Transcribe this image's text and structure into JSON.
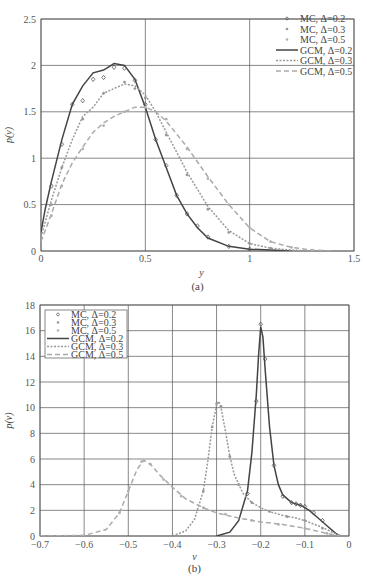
{
  "chart_data": [
    {
      "id": "a",
      "type": "line",
      "caption": "(a)",
      "xlabel": "y",
      "ylabel": "p(y)",
      "xlim": [
        0,
        1.5
      ],
      "ylim": [
        0,
        2.5
      ],
      "xticks": [
        "0",
        "0.5",
        "1",
        "1.5"
      ],
      "yticks": [
        "0",
        "0.5",
        "1",
        "1.5",
        "2",
        "2.5"
      ],
      "grid": true,
      "legend_position": "upper right",
      "legend": [
        "MC, Δ=0.2",
        "MC, Δ=0.3",
        "MC, Δ=0.5",
        "GCM, Δ=0.2",
        "GCM, Δ=0.3",
        "GCM, Δ=0.5"
      ],
      "series": [
        {
          "name": "GCM, Δ=0.2",
          "style": "solid",
          "color": "#444444",
          "x": [
            0,
            0.02,
            0.05,
            0.1,
            0.15,
            0.2,
            0.25,
            0.3,
            0.35,
            0.4,
            0.45,
            0.5,
            0.55,
            0.6,
            0.65,
            0.7,
            0.75,
            0.8,
            0.9,
            1.0,
            1.1,
            1.2
          ],
          "y": [
            0.2,
            0.45,
            0.75,
            1.2,
            1.58,
            1.78,
            1.92,
            1.95,
            2.02,
            2.0,
            1.85,
            1.55,
            1.2,
            0.9,
            0.6,
            0.4,
            0.25,
            0.14,
            0.05,
            0.02,
            0.01,
            0.0
          ]
        },
        {
          "name": "GCM, Δ=0.3",
          "style": "dotted",
          "color": "#999999",
          "x": [
            0,
            0.05,
            0.1,
            0.15,
            0.2,
            0.25,
            0.3,
            0.35,
            0.4,
            0.45,
            0.5,
            0.55,
            0.6,
            0.7,
            0.8,
            0.9,
            1.0,
            1.1,
            1.2,
            1.3
          ],
          "y": [
            0.15,
            0.55,
            0.9,
            1.2,
            1.45,
            1.55,
            1.7,
            1.75,
            1.8,
            1.78,
            1.68,
            1.5,
            1.28,
            0.85,
            0.48,
            0.22,
            0.08,
            0.03,
            0.01,
            0.0
          ]
        },
        {
          "name": "GCM, Δ=0.5",
          "style": "dashed",
          "color": "#aaaaaa",
          "x": [
            0,
            0.05,
            0.1,
            0.15,
            0.2,
            0.25,
            0.3,
            0.35,
            0.4,
            0.45,
            0.5,
            0.55,
            0.6,
            0.7,
            0.8,
            0.9,
            1.0,
            1.1,
            1.2,
            1.3,
            1.4
          ],
          "y": [
            0.1,
            0.4,
            0.72,
            0.95,
            1.12,
            1.28,
            1.38,
            1.45,
            1.5,
            1.55,
            1.55,
            1.5,
            1.4,
            1.12,
            0.8,
            0.5,
            0.25,
            0.1,
            0.04,
            0.01,
            0.0
          ]
        },
        {
          "name": "MC, Δ=0.2",
          "style": "marker-diamond",
          "color": "#555555",
          "x": [
            0.05,
            0.1,
            0.15,
            0.2,
            0.25,
            0.3,
            0.35,
            0.4,
            0.45,
            0.5,
            0.55,
            0.6,
            0.65,
            0.7,
            0.75,
            0.8,
            0.9,
            1.0
          ],
          "y": [
            0.7,
            1.15,
            1.58,
            1.62,
            1.85,
            1.87,
            1.98,
            1.97,
            1.84,
            1.58,
            1.2,
            0.92,
            0.6,
            0.4,
            0.27,
            0.15,
            0.05,
            0.02
          ]
        },
        {
          "name": "MC, Δ=0.3",
          "style": "marker",
          "color": "#999999",
          "x": [
            0.05,
            0.1,
            0.2,
            0.3,
            0.4,
            0.45,
            0.5,
            0.6,
            0.7,
            0.8,
            0.9,
            1.0,
            1.1
          ],
          "y": [
            0.5,
            0.9,
            1.42,
            1.7,
            1.82,
            1.75,
            1.65,
            1.25,
            0.82,
            0.45,
            0.2,
            0.08,
            0.03
          ]
        },
        {
          "name": "MC, Δ=0.5",
          "style": "marker",
          "color": "#b0b0b0",
          "x": [
            0.05,
            0.1,
            0.2,
            0.3,
            0.4,
            0.5,
            0.6,
            0.7,
            0.8,
            0.9,
            1.0,
            1.1,
            1.2,
            1.3
          ],
          "y": [
            0.38,
            0.7,
            1.1,
            1.35,
            1.5,
            1.55,
            1.42,
            1.1,
            0.78,
            0.5,
            0.25,
            0.1,
            0.04,
            0.01
          ]
        }
      ]
    },
    {
      "id": "b",
      "type": "line",
      "caption": "(b)",
      "xlabel": "v",
      "ylabel": "p(v)",
      "xlim": [
        -0.7,
        0
      ],
      "ylim": [
        0,
        18
      ],
      "xticks": [
        "−0.7",
        "−0.6",
        "−0.5",
        "−0.4",
        "−0.3",
        "−0.2",
        "−0.1",
        "0"
      ],
      "yticks": [
        "0",
        "2",
        "4",
        "6",
        "8",
        "10",
        "12",
        "14",
        "16",
        "18"
      ],
      "grid": true,
      "legend_position": "upper left",
      "legend": [
        "MC, Δ=0.2",
        "MC, Δ=0.3",
        "MC, Δ=0.5",
        "GCM, Δ=0.2",
        "GCM, Δ=0.3",
        "GCM, Δ=0.5"
      ],
      "series": [
        {
          "name": "GCM, Δ=0.2",
          "style": "solid",
          "color": "#444444",
          "x": [
            -0.3,
            -0.27,
            -0.25,
            -0.23,
            -0.22,
            -0.21,
            -0.205,
            -0.2,
            -0.195,
            -0.19,
            -0.18,
            -0.17,
            -0.16,
            -0.15,
            -0.13,
            -0.11,
            -0.09,
            -0.07,
            -0.05,
            -0.03,
            -0.02
          ],
          "y": [
            0,
            0.3,
            1.2,
            3.5,
            6.5,
            11,
            14,
            16.3,
            15.5,
            13,
            8.5,
            5.5,
            4,
            3.2,
            2.6,
            2.4,
            2.0,
            1.4,
            0.8,
            0.2,
            0
          ]
        },
        {
          "name": "GCM, Δ=0.3",
          "style": "dotted",
          "color": "#999999",
          "x": [
            -0.4,
            -0.37,
            -0.35,
            -0.33,
            -0.32,
            -0.31,
            -0.3,
            -0.295,
            -0.29,
            -0.28,
            -0.27,
            -0.26,
            -0.24,
            -0.22,
            -0.2,
            -0.18,
            -0.15,
            -0.12,
            -0.1,
            -0.07,
            -0.05,
            -0.02
          ],
          "y": [
            0,
            0.4,
            1.3,
            3.5,
            5.8,
            8.5,
            10.2,
            10.5,
            10.0,
            8.2,
            6.2,
            4.8,
            3.3,
            2.6,
            2.2,
            1.9,
            1.6,
            1.4,
            1.2,
            0.8,
            0.5,
            0
          ]
        },
        {
          "name": "GCM, Δ=0.5",
          "style": "dashed",
          "color": "#aaaaaa",
          "x": [
            -0.7,
            -0.6,
            -0.55,
            -0.52,
            -0.5,
            -0.48,
            -0.465,
            -0.45,
            -0.43,
            -0.4,
            -0.37,
            -0.33,
            -0.3,
            -0.25,
            -0.2,
            -0.15,
            -0.1,
            -0.05,
            -0.02
          ],
          "y": [
            0,
            0.05,
            0.5,
            1.8,
            3.5,
            5.2,
            5.9,
            5.6,
            4.8,
            3.8,
            2.9,
            2.2,
            1.8,
            1.4,
            1.1,
            0.9,
            0.6,
            0.2,
            0
          ]
        },
        {
          "name": "MC, Δ=0.2",
          "style": "marker-diamond",
          "color": "#555555",
          "x": [
            -0.23,
            -0.21,
            -0.2,
            -0.19,
            -0.17,
            -0.15,
            -0.13,
            -0.12,
            -0.11,
            -0.1,
            -0.08,
            -0.06
          ],
          "y": [
            3.3,
            10.5,
            16.5,
            13.8,
            5.5,
            3.1,
            2.6,
            2.5,
            2.4,
            2.3,
            1.8,
            1.2
          ]
        },
        {
          "name": "MC, Δ=0.3",
          "style": "marker",
          "color": "#999999",
          "x": [
            -0.33,
            -0.31,
            -0.3,
            -0.29,
            -0.27,
            -0.25,
            -0.22,
            -0.18,
            -0.14,
            -0.1,
            -0.06
          ],
          "y": [
            3.5,
            8.5,
            10.3,
            10.1,
            6.2,
            4.0,
            2.6,
            1.9,
            1.5,
            1.2,
            0.6
          ]
        },
        {
          "name": "MC, Δ=0.5",
          "style": "marker",
          "color": "#b0b0b0",
          "x": [
            -0.52,
            -0.5,
            -0.47,
            -0.45,
            -0.42,
            -0.38,
            -0.33,
            -0.28,
            -0.22,
            -0.16,
            -0.1,
            -0.05
          ],
          "y": [
            1.8,
            3.5,
            5.8,
            5.6,
            4.4,
            3.1,
            2.2,
            1.7,
            1.2,
            0.9,
            0.6,
            0.2
          ]
        }
      ]
    }
  ],
  "legend_markers": {
    "mc": "◇",
    "gcm": "line"
  }
}
